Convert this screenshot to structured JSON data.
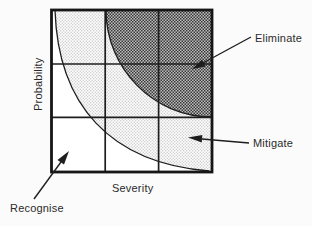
{
  "diagram": {
    "type": "risk-assessment-matrix",
    "y_axis_label": "Probability",
    "x_axis_label": "Severity",
    "grid": {
      "rows": 3,
      "columns": 3
    },
    "regions": [
      {
        "label": "Eliminate",
        "position": "top-right",
        "fill": "dark-halftone"
      },
      {
        "label": "Mitigate",
        "position": "middle-band",
        "fill": "light-halftone"
      },
      {
        "label": "Recognise",
        "position": "bottom-left",
        "fill": "white"
      }
    ],
    "colors": {
      "line": "#1e1e1e",
      "text": "#2b2b2b",
      "dark_region_avg": "#8a8a8a",
      "light_region_avg": "#eaeaea",
      "background": "#fbfbfb"
    }
  }
}
